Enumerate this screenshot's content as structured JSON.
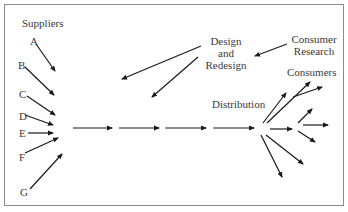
{
  "diagram": {
    "type": "flow",
    "labels": {
      "suppliers": "Suppliers",
      "supplier_letters": [
        "A",
        "B",
        "C",
        "D",
        "E",
        "F",
        "G"
      ],
      "design_line1": "Design",
      "design_line2": "and",
      "design_line3": "Redesign",
      "consumer_research_line1": "Consumer",
      "consumer_research_line2": "Research",
      "distribution": "Distribution",
      "consumers": "Consumers"
    },
    "colors": {
      "arrow": "#1a1a1a",
      "border": "#8a8a8a",
      "text": "#3a3a3a"
    }
  }
}
